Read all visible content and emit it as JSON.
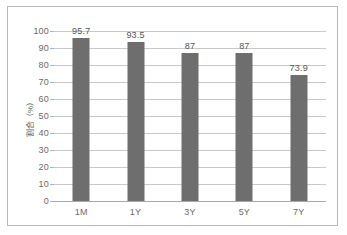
{
  "chart_data": {
    "type": "bar",
    "title": "",
    "subtitle": "",
    "xlabel": "",
    "ylabel": "割合（%）",
    "categories": [
      "1M",
      "1Y",
      "3Y",
      "5Y",
      "7Y"
    ],
    "values": [
      95.7,
      93.5,
      87,
      87,
      73.9
    ],
    "value_labels": [
      "95.7",
      "93.5",
      "87",
      "87",
      "73.9"
    ],
    "ylim": [
      0,
      100
    ],
    "ytick_labels": [
      "100",
      "90",
      "80",
      "70",
      "60",
      "50",
      "40",
      "30",
      "20",
      "10",
      "0"
    ],
    "ytick_values": [
      100,
      90,
      80,
      70,
      60,
      50,
      40,
      30,
      20,
      10,
      0
    ],
    "grid": true,
    "legend": false,
    "legend_position": "none",
    "bar_color": "#6e6e6e",
    "gridline_color": "#c8c8c8",
    "frame_color": "#b9b9b9",
    "background": "#ffffff"
  }
}
